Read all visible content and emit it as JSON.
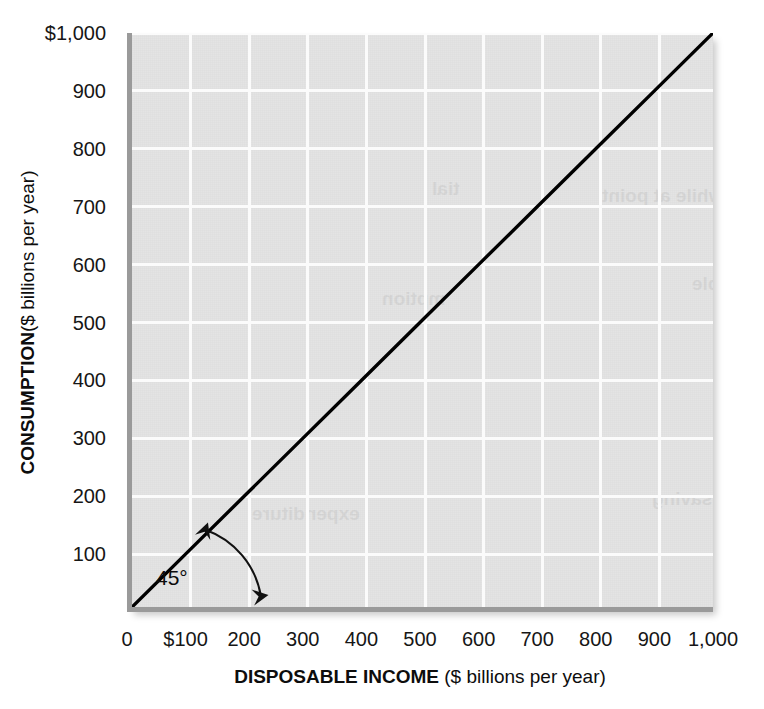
{
  "figure": {
    "bleed_fragment": "",
    "background_color": "#ffffff",
    "plot_background_color": "#e4e4e4",
    "gridline_color": "#fbfbfb",
    "axis_color": "#9a9a9a",
    "line_color": "#000000"
  },
  "axes": {
    "x": {
      "title_strong": "DISPOSABLE INCOME",
      "title_rest": " ($ billions per year)",
      "ticks": [
        "0",
        "$100",
        "200",
        "300",
        "400",
        "500",
        "600",
        "700",
        "800",
        "900",
        "1,000"
      ],
      "values": [
        0,
        100,
        200,
        300,
        400,
        500,
        600,
        700,
        800,
        900,
        1000
      ],
      "min": 0,
      "max": 1000
    },
    "y": {
      "title_strong": "CONSUMPTION",
      "title_rest": " ($ billions per year)",
      "ticks": [
        "100",
        "200",
        "300",
        "400",
        "500",
        "600",
        "700",
        "800",
        "900",
        "$1,000"
      ],
      "values": [
        100,
        200,
        300,
        400,
        500,
        600,
        700,
        800,
        900,
        1000
      ],
      "min": 0,
      "max": 1000
    }
  },
  "annotation": {
    "angle_label": "45°"
  },
  "ghost_text": [
    {
      "text": "that, while at point",
      "left": 470,
      "top": 152,
      "size": 19
    },
    {
      "text": "tial",
      "left": 300,
      "top": 145,
      "size": 19
    },
    {
      "text": "disposable",
      "left": 560,
      "top": 240,
      "size": 19
    },
    {
      "text": "mption",
      "left": 250,
      "top": 255,
      "size": 19
    },
    {
      "text": "expenditure",
      "left": 120,
      "top": 470,
      "size": 19
    },
    {
      "text": "saving",
      "left": 520,
      "top": 455,
      "size": 19
    }
  ],
  "chart_data": {
    "type": "line",
    "title": "",
    "xlabel": "DISPOSABLE INCOME ($ billions per year)",
    "ylabel": "CONSUMPTION ($ billions per year)",
    "xlim": [
      0,
      1000
    ],
    "ylim": [
      0,
      1000
    ],
    "xticks": [
      0,
      100,
      200,
      300,
      400,
      500,
      600,
      700,
      800,
      900,
      1000
    ],
    "yticks": [
      100,
      200,
      300,
      400,
      500,
      600,
      700,
      800,
      900,
      1000
    ],
    "xticklabels": [
      "0",
      "$100",
      "200",
      "300",
      "400",
      "500",
      "600",
      "700",
      "800",
      "900",
      "1,000"
    ],
    "yticklabels": [
      "100",
      "200",
      "300",
      "400",
      "500",
      "600",
      "700",
      "800",
      "900",
      "$1,000"
    ],
    "grid": true,
    "legend": false,
    "series": [
      {
        "name": "45-degree line (Consumption = Disposable Income)",
        "color": "#000000",
        "x": [
          0,
          100,
          200,
          300,
          400,
          500,
          600,
          700,
          800,
          900,
          1000
        ],
        "y": [
          0,
          100,
          200,
          300,
          400,
          500,
          600,
          700,
          800,
          900,
          1000
        ]
      }
    ],
    "annotations": [
      {
        "text": "45°",
        "x": 150,
        "y": 55,
        "kind": "angle-arc"
      }
    ]
  }
}
